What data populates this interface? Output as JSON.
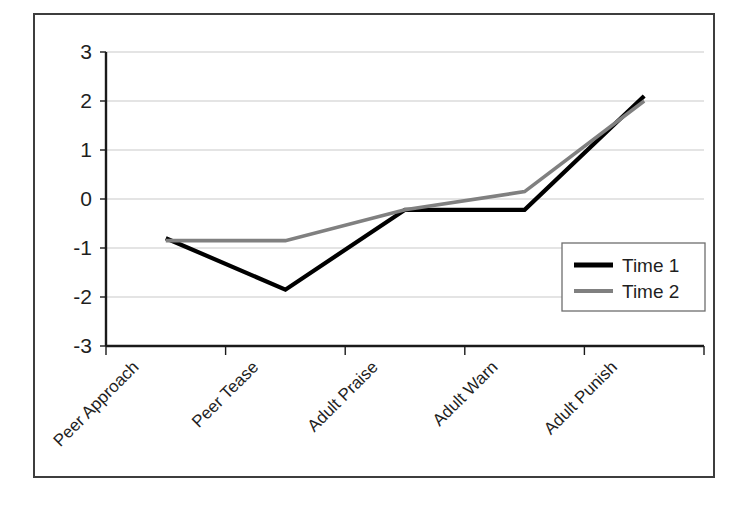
{
  "chart_data": {
    "type": "line",
    "title": "",
    "xlabel": "",
    "ylabel": "",
    "categories": [
      "Peer Approach",
      "Peer Tease",
      "Adult Praise",
      "Adult Warn",
      "Adult Punish"
    ],
    "series": [
      {
        "name": "Time 1",
        "color": "#000000",
        "values": [
          -0.8,
          -1.85,
          -0.22,
          -0.22,
          2.1
        ]
      },
      {
        "name": "Time 2",
        "color": "#808080",
        "values": [
          -0.85,
          -0.85,
          -0.22,
          0.15,
          2.0
        ]
      }
    ],
    "ylim": [
      -3,
      3
    ],
    "yticks": [
      3,
      2,
      1,
      0,
      -1,
      -2,
      -3
    ],
    "ytick_labels": [
      "3",
      "2",
      "1",
      "0",
      "-1",
      "-2",
      "-3"
    ],
    "grid": true,
    "grid_axis": "y",
    "legend_position": "center-right",
    "legend_entries": [
      "Time 1",
      "Time 2"
    ],
    "xtick_label_rotation": 45
  },
  "colors": {
    "series_1": "#000000",
    "series_2": "#808080",
    "gridline": "#c9c9c9",
    "axis": "#1a1a1a",
    "border": "#3d3d3d",
    "background": "#ffffff"
  }
}
